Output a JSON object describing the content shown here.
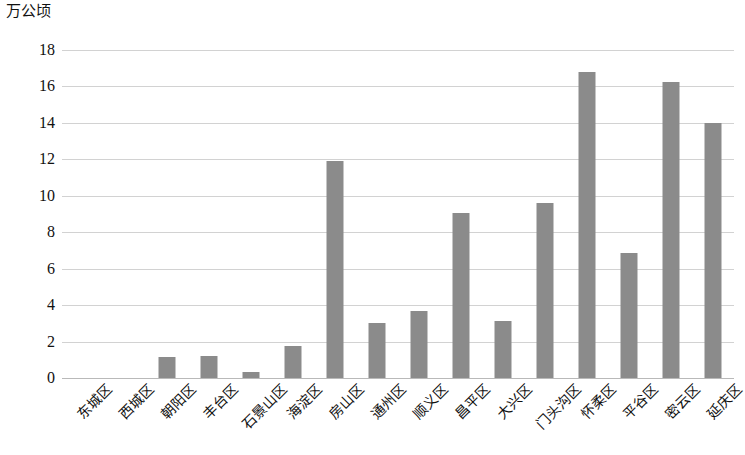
{
  "chart_data": {
    "type": "bar",
    "title": "",
    "subtitle": "",
    "xlabel": "",
    "ylabel": "万公顷",
    "ylim": [
      0,
      18
    ],
    "ytick_step": 2,
    "yticks": [
      "18",
      "16",
      "14",
      "12",
      "10",
      "8",
      "6",
      "4",
      "2",
      "0"
    ],
    "grid": true,
    "legend": "none",
    "bar_color": "#8b8b8b",
    "categories": [
      "东城区",
      "西城区",
      "朝阳区",
      "丰台区",
      "石景山区",
      "海淀区",
      "房山区",
      "通州区",
      "顺义区",
      "昌平区",
      "大兴区",
      "门头沟区",
      "怀柔区",
      "平谷区",
      "密云区",
      "延庆区"
    ],
    "values": [
      0,
      0,
      1.15,
      1.2,
      0.33,
      1.75,
      11.9,
      3.0,
      3.7,
      9.05,
      3.15,
      9.6,
      16.8,
      6.85,
      16.25,
      14.0
    ]
  }
}
